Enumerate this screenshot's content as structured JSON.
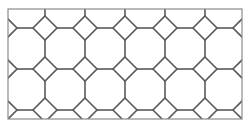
{
  "figure": {
    "frame": {
      "x": 8,
      "y": 9,
      "w": 234,
      "h": 110
    },
    "stroke_color": "#5a5a5a",
    "frame_color": "#8a8a8a",
    "background": "#ffffff",
    "diamond_cols_x": [
      45,
      85,
      125,
      165,
      205
    ],
    "diamond_rows_y": [
      28,
      69,
      110
    ],
    "edge_half_diamond_x": [
      8,
      242
    ],
    "half_diagonal": 12
  }
}
